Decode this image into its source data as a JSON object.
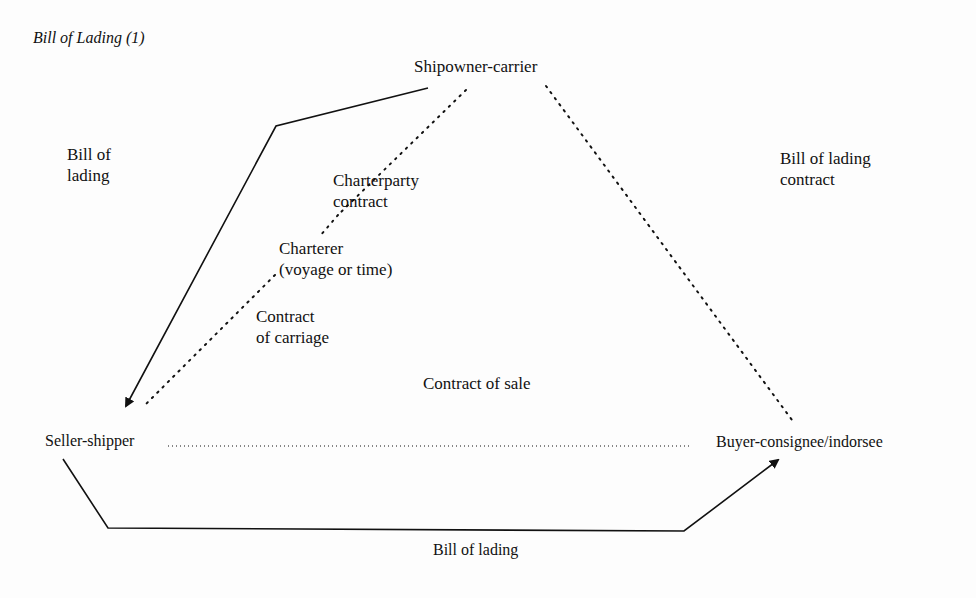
{
  "title": "Bill of Lading (1)",
  "nodes": {
    "shipowner": "Shipowner-carrier",
    "charterer_line1": "Charterer",
    "charterer_line2": "(voyage or time)",
    "seller": "Seller-shipper",
    "buyer": "Buyer-consignee/indorsee"
  },
  "edge_labels": {
    "bol_left_line1": "Bill of",
    "bol_left_line2": "lading",
    "charterparty_line1": "Charterparty",
    "charterparty_line2": "contract",
    "carriage_line1": "Contract",
    "carriage_line2": "of carriage",
    "sale": "Contract of sale",
    "bol_contract_line1": "Bill of lading",
    "bol_contract_line2": "contract",
    "bol_bottom": "Bill of lading"
  },
  "colors": {
    "ink": "#111111",
    "paper": "#fdfdfd"
  }
}
